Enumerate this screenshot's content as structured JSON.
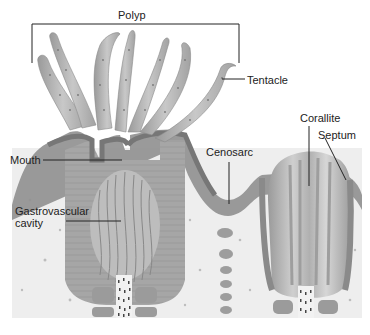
{
  "labels": {
    "polyp": "Polyp",
    "tentacle": "Tentacle",
    "corallite": "Corallite",
    "septum": "Septum",
    "mouth": "Mouth",
    "cenosarc": "Cenosarc",
    "gastrovascular_line1": "Gastrovascular",
    "gastrovascular_line2": "cavity"
  },
  "colors": {
    "background": "#ffffff",
    "substrate": "#eeeeee",
    "tissue_dark": "#8e8e8e",
    "tissue_mid": "#a9a9a9",
    "tissue_light": "#c9c9c9",
    "tentacle_fill": "#b8b8b8",
    "leader_line": "#222222"
  }
}
